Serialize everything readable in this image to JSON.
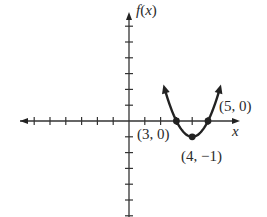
{
  "chart_data": {
    "type": "line",
    "title": "",
    "xlabel": "x",
    "ylabel": "f(x)",
    "function": "f(x) = (x-3)(x-5) = x^2 - 8x + 15",
    "xlim": [
      -7,
      6
    ],
    "ylim": [
      -7,
      6
    ],
    "grid": false,
    "x_ticks": [
      -6,
      -5,
      -4,
      -3,
      -2,
      -1,
      1,
      2,
      3,
      4,
      5
    ],
    "y_ticks": [
      -6,
      -5,
      -4,
      -3,
      -2,
      -1,
      1,
      2,
      3,
      4,
      5,
      6
    ],
    "series": [
      {
        "name": "parabola",
        "x": [
          2.3,
          2.6,
          3,
          3.5,
          4,
          4.5,
          5,
          5.4,
          5.7
        ],
        "y": [
          2.89,
          1.56,
          0,
          -0.75,
          -1,
          -0.75,
          0,
          1.56,
          2.89
        ]
      }
    ],
    "points": [
      {
        "x": 3,
        "y": 0,
        "label": "(3, 0)"
      },
      {
        "x": 4,
        "y": -1,
        "label": "(4, −1)"
      },
      {
        "x": 5,
        "y": 0,
        "label": "(5, 0)"
      }
    ]
  },
  "labels": {
    "y_axis": "f(x)",
    "x_axis": "x",
    "p1": "(3, 0)",
    "p2": "(4, −1)",
    "p3": "(5, 0)"
  }
}
